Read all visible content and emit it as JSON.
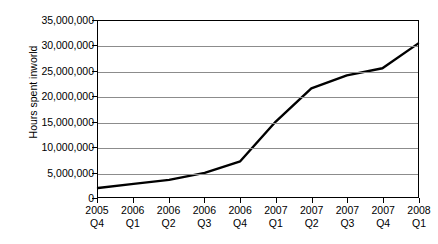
{
  "chart_data": {
    "type": "line",
    "title": "",
    "xlabel": "",
    "ylabel": "Hours spent inworld",
    "categories": [
      "2005 Q4",
      "2006 Q1",
      "2006 Q2",
      "2006 Q3",
      "2006 Q4",
      "2007 Q1",
      "2007 Q2",
      "2007 Q3",
      "2007 Q4",
      "2008 Q1"
    ],
    "category_years": [
      "2005",
      "2006",
      "2006",
      "2006",
      "2006",
      "2007",
      "2007",
      "2007",
      "2007",
      "2008"
    ],
    "category_quarters": [
      "Q4",
      "Q1",
      "Q2",
      "Q3",
      "Q4",
      "Q1",
      "Q2",
      "Q3",
      "Q4",
      "Q1"
    ],
    "values": [
      1800000,
      2600000,
      3400000,
      4800000,
      7100000,
      15000000,
      21600000,
      24200000,
      25600000,
      30500000
    ],
    "ylim": [
      0,
      35000000
    ],
    "ytick_values": [
      0,
      5000000,
      10000000,
      15000000,
      20000000,
      25000000,
      30000000,
      35000000
    ],
    "ytick_labels": [
      "0",
      "5,000,000",
      "10,000,000",
      "15,000,000",
      "20,000,000",
      "25,000,000",
      "30,000,000",
      "35,000,000"
    ],
    "grid": true,
    "legend": false,
    "series_color": "#000000",
    "gridline_color": "#8c8c8c",
    "axis_color": "#000000",
    "background_color": "#ffffff"
  }
}
